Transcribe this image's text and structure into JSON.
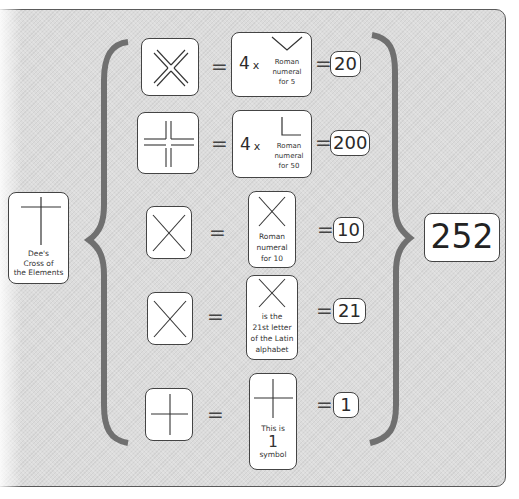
{
  "source_symbol": {
    "name": "Dee's Cross of the Elements",
    "label_lines": [
      "Dee's",
      "Cross of",
      "the Elements"
    ]
  },
  "rows": [
    {
      "symbol": "double-x-cross",
      "multiplier": "4",
      "times": "x",
      "value_glyph": "V",
      "value_lines": [
        "Roman",
        "numeral",
        "for 5"
      ],
      "result": "20"
    },
    {
      "symbol": "double-line-cross",
      "multiplier": "4",
      "times": "x",
      "value_glyph": "L",
      "value_lines": [
        "Roman",
        "numeral",
        "for 50"
      ],
      "result": "200"
    },
    {
      "symbol": "x-cross",
      "value_glyph": "X",
      "value_lines": [
        "Roman",
        "numeral",
        "for 10"
      ],
      "result": "10"
    },
    {
      "symbol": "x-cross",
      "value_glyph": "X",
      "value_lines": [
        "is the",
        "21st letter",
        "of the Latin",
        "alphabet"
      ],
      "result": "21"
    },
    {
      "symbol": "plus-cross",
      "value_glyph": "+",
      "value_lines": [
        "This is",
        "1",
        "symbol"
      ],
      "result": "1"
    }
  ],
  "equals": "=",
  "total": "252",
  "colors": {
    "panel_background": "#dcdcdc",
    "brace": "#707070",
    "box_border": "#444444",
    "box_fill": "#ffffff"
  }
}
